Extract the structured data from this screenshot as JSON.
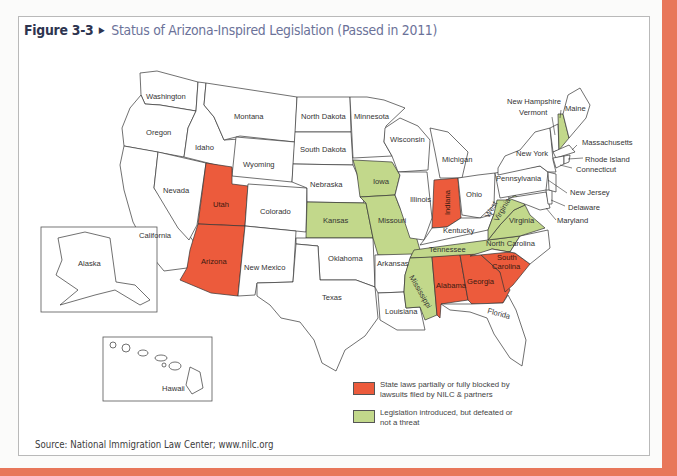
{
  "figure": {
    "number": "Figure 3-3",
    "arrow_icon": "▶",
    "caption": "Status of Arizona-Inspired Legislation (Passed in 2011)",
    "source": "Source: National Immigration Law Center; www.nilc.org"
  },
  "colors": {
    "page_border": "#e8775a",
    "blocked_red": "#ec5b3c",
    "defeated_green": "#c2d88b",
    "title_dark": "#2e3550",
    "title_light": "#6b7299"
  },
  "legend": [
    {
      "key": "blocked",
      "color": "#ec5b3c",
      "label": "State laws partially or fully blocked by lawsuits filed by NILC & partners"
    },
    {
      "key": "defeated",
      "color": "#c2d88b",
      "label": "Legislation introduced, but defeated or not a threat"
    }
  ],
  "states": {
    "washington": "Washington",
    "oregon": "Oregon",
    "california": "California",
    "nevada": "Nevada",
    "idaho": "Idaho",
    "montana": "Montana",
    "wyoming": "Wyoming",
    "utah": "Utah",
    "arizona": "Arizona",
    "colorado": "Colorado",
    "new_mexico": "New Mexico",
    "north_dakota": "North Dakota",
    "south_dakota": "South Dakota",
    "nebraska": "Nebraska",
    "kansas": "Kansas",
    "oklahoma": "Oklahoma",
    "texas": "Texas",
    "minnesota": "Minnesota",
    "iowa": "Iowa",
    "missouri": "Missouri",
    "arkansas": "Arkansas",
    "louisiana": "Louisiana",
    "wisconsin": "Wisconsin",
    "illinois": "Illinois",
    "michigan": "Michigan",
    "indiana": "Indiana",
    "ohio": "Ohio",
    "kentucky": "Kentucky",
    "tennessee": "Tennessee",
    "mississippi": "Mississippi",
    "alabama": "Alabama",
    "georgia": "Georgia",
    "florida": "Florida",
    "south_carolina_1": "South",
    "south_carolina_2": "Carolina",
    "north_carolina": "North Carolina",
    "virginia": "Virginia",
    "west_virginia_1": "West",
    "west_virginia_2": "Virginia",
    "pennsylvania": "Pennsylvania",
    "new_york": "New York",
    "vermont": "Vermont",
    "new_hampshire": "New Hampshire",
    "maine": "Maine",
    "massachusetts": "Massachusetts",
    "rhode_island": "Rhode Island",
    "connecticut": "Connecticut",
    "new_jersey": "New Jersey",
    "delaware": "Delaware",
    "maryland": "Maryland",
    "alaska": "Alaska",
    "hawaii": "Hawaii"
  },
  "status": {
    "blocked": [
      "Utah",
      "Arizona",
      "Indiana",
      "Alabama",
      "Georgia",
      "South Carolina"
    ],
    "defeated": [
      "Kansas",
      "Iowa",
      "Missouri",
      "Tennessee",
      "Mississippi",
      "West Virginia",
      "Virginia",
      "New Hampshire"
    ]
  }
}
